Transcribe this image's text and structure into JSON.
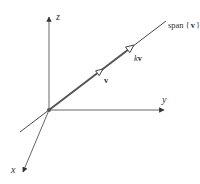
{
  "diagram": {
    "colors": {
      "axis": "#555555",
      "line": "#333333",
      "vector": "#555555",
      "label": "#333333",
      "background": "#ffffff"
    },
    "origin": {
      "x": 49,
      "y": 110
    },
    "axes": [
      {
        "name": "z",
        "label": "z",
        "end": {
          "x": 49,
          "y": 15
        },
        "label_pos": {
          "x": 56,
          "y": 20
        }
      },
      {
        "name": "y",
        "label": "y",
        "end": {
          "x": 164,
          "y": 110
        },
        "label_pos": {
          "x": 162,
          "y": 103
        }
      },
      {
        "name": "x",
        "label": "x",
        "end": {
          "x": 22,
          "y": 173
        },
        "label_pos": {
          "x": 11,
          "y": 173
        }
      }
    ],
    "span_line": {
      "label_text": "span",
      "label_braces_open": "{",
      "label_vec": "v",
      "label_braces_close": "}",
      "start": {
        "x": 20,
        "y": 132
      },
      "end": {
        "x": 166,
        "y": 21
      }
    },
    "vectors": [
      {
        "name": "v",
        "label": "v",
        "head": {
          "x": 103,
          "y": 69
        },
        "label_pos": {
          "x": 104,
          "y": 83
        }
      },
      {
        "name": "kv",
        "label_scalar": "k",
        "label_vec": "v",
        "head": {
          "x": 133,
          "y": 45
        },
        "label_pos": {
          "x": 134,
          "y": 61
        }
      }
    ]
  }
}
